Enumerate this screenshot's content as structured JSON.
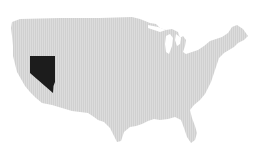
{
  "map": {
    "type": "choropleth",
    "region": "United States (contiguous)",
    "background_color": "#ffffff",
    "base_fill_color": "#d9d9d9",
    "highlight_fill_color": "#1c1c1c",
    "highlighted_states": [
      "Nevada"
    ]
  }
}
